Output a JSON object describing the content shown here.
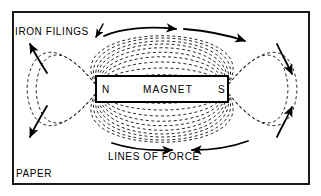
{
  "figure": {
    "kind": "magnetic-field-diagram",
    "background_color": "#ffffff",
    "ink_color": "#000000",
    "frame": {
      "border_color": "#1a1a1a",
      "border_width_px": 2,
      "x": 12,
      "y": 11,
      "width": 298,
      "height": 174
    }
  },
  "labels": {
    "iron_filings": "IRON FILINGS",
    "lines_of_force": "LINES OF FORCE",
    "paper": "PAPER"
  },
  "magnet": {
    "title": "MAGNET",
    "north_pole": "N",
    "south_pole": "S",
    "x": 96,
    "y": 76,
    "width": 132,
    "height": 26,
    "fill": "#ffffff",
    "stroke": "#000000",
    "stroke_width_px": 2
  },
  "field": {
    "dash_pattern": "3 2.6",
    "line_color": "#2b2b2b",
    "line_width_px": 1,
    "center_x": 162,
    "pole_left_x": 99,
    "pole_right_x": 225,
    "pole_y": 89,
    "upper_loop_heights": [
      10,
      20,
      29,
      37,
      44,
      50,
      56,
      61,
      65,
      69,
      72
    ],
    "lower_loop_heights": [
      10,
      20,
      29,
      37,
      44,
      50,
      56,
      61,
      65,
      69,
      72
    ],
    "loop_count_per_side": 11,
    "direction": "north-to-south-outside"
  },
  "arrows": {
    "color": "#000000",
    "width_px": 1.8,
    "top": [
      {
        "name": "top-left-arrow",
        "direction": "right"
      },
      {
        "name": "top-right-arrow",
        "direction": "right"
      }
    ],
    "bottom": [
      {
        "name": "bottom-left-arrow",
        "direction": "right"
      },
      {
        "name": "bottom-right-arrow",
        "direction": "left"
      }
    ],
    "left": [
      {
        "name": "left-upper-arc-arrow",
        "direction": "up-left"
      },
      {
        "name": "left-lower-arc-arrow",
        "direction": "down-left"
      }
    ],
    "right": [
      {
        "name": "right-upper-arc-arrow",
        "direction": "down-right"
      },
      {
        "name": "right-lower-arc-arrow",
        "direction": "up-right"
      }
    ],
    "pointer": [
      {
        "name": "iron-filings-pointer",
        "direction": "down-left"
      }
    ]
  }
}
